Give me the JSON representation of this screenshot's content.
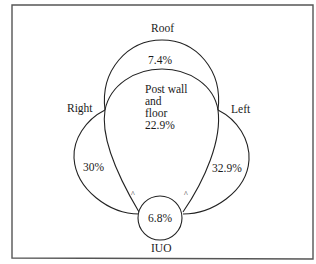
{
  "diagram": {
    "type": "venn-like region diagram",
    "regions": [
      {
        "id": "roof",
        "name": "Roof",
        "value": "7.4%"
      },
      {
        "id": "post-wall-floor",
        "name_lines": [
          "Post wall",
          "and",
          "floor"
        ],
        "value": "22.9%"
      },
      {
        "id": "right",
        "name": "Right",
        "value": "30%"
      },
      {
        "id": "left",
        "name": "Left",
        "value": "32.9%"
      },
      {
        "id": "iuo",
        "name": "IUO",
        "value": "6.8%"
      }
    ],
    "marks": [
      "^",
      "^"
    ],
    "colors": {
      "line": "#222222",
      "frame": "#555555",
      "background": "#ffffff"
    }
  }
}
